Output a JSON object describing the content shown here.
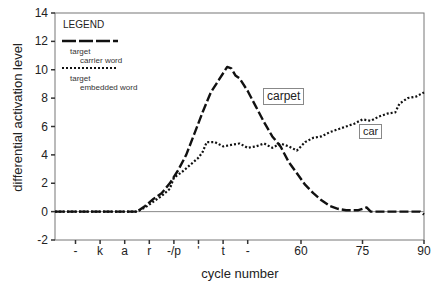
{
  "chart_data": {
    "type": "line",
    "title": "",
    "xlabel": "cycle number",
    "ylabel": "differential activation level",
    "xlim": [
      0,
      90
    ],
    "ylim": [
      -2,
      14
    ],
    "yticks": [
      -2,
      0,
      2,
      4,
      6,
      8,
      10,
      12,
      14
    ],
    "xticks": [
      {
        "x": 5,
        "label": "-"
      },
      {
        "x": 11,
        "label": "k"
      },
      {
        "x": 17,
        "label": "a"
      },
      {
        "x": 23,
        "label": "r"
      },
      {
        "x": 29,
        "label": "-/p"
      },
      {
        "x": 35,
        "label": "'"
      },
      {
        "x": 41,
        "label": "t"
      },
      {
        "x": 47,
        "label": "-"
      },
      {
        "x": 60,
        "label": "60"
      },
      {
        "x": 75,
        "label": "75"
      },
      {
        "x": 90,
        "label": "90"
      }
    ],
    "grid": false,
    "legend": {
      "title": "LEGEND",
      "position": "top-left",
      "entries": [
        {
          "style": "dashed",
          "label_line1": "target",
          "label_line2": "carrier word"
        },
        {
          "style": "dotted",
          "label_line1": "target",
          "label_line2": "embedded word"
        }
      ]
    },
    "series": [
      {
        "name": "carpet",
        "style": "dashed",
        "points": [
          [
            0,
            0
          ],
          [
            20,
            0
          ],
          [
            22,
            0.4
          ],
          [
            24,
            0.9
          ],
          [
            26,
            1.3
          ],
          [
            28,
            2.0
          ],
          [
            30,
            2.9
          ],
          [
            32,
            4.0
          ],
          [
            34,
            5.5
          ],
          [
            36,
            7.0
          ],
          [
            38,
            8.4
          ],
          [
            40,
            9.3
          ],
          [
            42,
            10.2
          ],
          [
            43,
            10.1
          ],
          [
            44,
            9.6
          ],
          [
            45,
            9.4
          ],
          [
            47,
            8.5
          ],
          [
            49,
            7.4
          ],
          [
            51,
            6.3
          ],
          [
            53,
            5.3
          ],
          [
            55,
            4.6
          ],
          [
            57,
            3.5
          ],
          [
            59,
            2.7
          ],
          [
            61,
            1.9
          ],
          [
            63,
            1.3
          ],
          [
            65,
            0.8
          ],
          [
            67,
            0.4
          ],
          [
            69,
            0.2
          ],
          [
            71,
            0.1
          ],
          [
            74,
            0.1
          ],
          [
            76,
            0.3
          ],
          [
            77,
            0.0
          ],
          [
            80,
            0.0
          ],
          [
            85,
            0.0
          ],
          [
            89,
            0.0
          ],
          [
            90,
            -0.2
          ]
        ]
      },
      {
        "name": "car",
        "style": "dotted",
        "points": [
          [
            0,
            0
          ],
          [
            20,
            0
          ],
          [
            22,
            0.3
          ],
          [
            24,
            0.7
          ],
          [
            26,
            1.1
          ],
          [
            28,
            1.6
          ],
          [
            29,
            2.4
          ],
          [
            31,
            2.8
          ],
          [
            33,
            3.3
          ],
          [
            35,
            3.8
          ],
          [
            36,
            4.2
          ],
          [
            37,
            4.9
          ],
          [
            39,
            4.9
          ],
          [
            41,
            4.6
          ],
          [
            43,
            4.7
          ],
          [
            45,
            4.8
          ],
          [
            47,
            4.5
          ],
          [
            49,
            4.6
          ],
          [
            51,
            4.8
          ],
          [
            53,
            4.5
          ],
          [
            55,
            4.8
          ],
          [
            57,
            4.6
          ],
          [
            59,
            4.3
          ],
          [
            61,
            4.9
          ],
          [
            63,
            5.2
          ],
          [
            65,
            5.3
          ],
          [
            67,
            5.6
          ],
          [
            69,
            5.8
          ],
          [
            71,
            6.0
          ],
          [
            73,
            6.2
          ],
          [
            75,
            6.5
          ],
          [
            77,
            6.4
          ],
          [
            79,
            6.7
          ],
          [
            81,
            6.9
          ],
          [
            83,
            7.0
          ],
          [
            84,
            7.6
          ],
          [
            86,
            8.0
          ],
          [
            88,
            8.1
          ],
          [
            90,
            8.4
          ]
        ]
      }
    ],
    "annotations": [
      {
        "text": "carpet",
        "x": 54,
        "y": 7.7,
        "boxed": true
      },
      {
        "text": "car",
        "x": 75,
        "y": 5.3,
        "boxed": true
      }
    ]
  }
}
